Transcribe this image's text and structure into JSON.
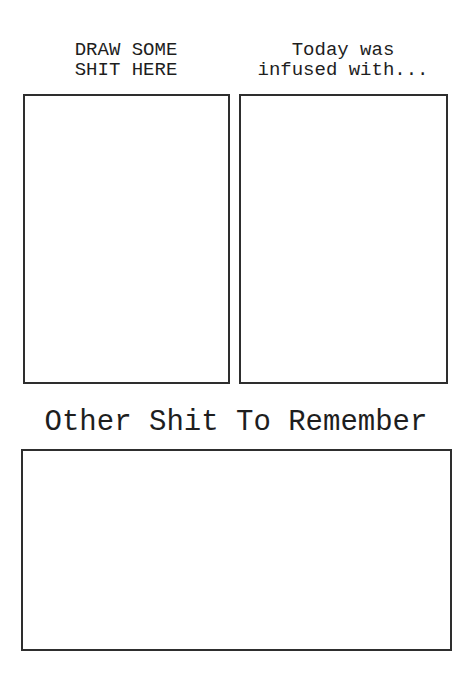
{
  "panels": {
    "left": {
      "title_line1": "DRAW SOME",
      "title_line2": "SHIT HERE"
    },
    "right": {
      "title_line1": "Today was",
      "title_line2": "infused with..."
    }
  },
  "notes": {
    "title": "Other Shit To Remember"
  }
}
